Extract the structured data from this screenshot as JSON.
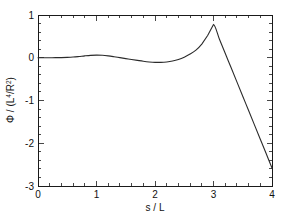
{
  "chart_data": {
    "type": "line",
    "title": "",
    "subtitle": "",
    "xlabel": "s / L",
    "ylabel": "Φ / (L⁴/R²)",
    "ylabel_parts": {
      "symbol": "Φ",
      "divider": " / (L",
      "num_exponent": "4",
      "mid": "/R",
      "den_exponent": "2",
      "close": ")"
    },
    "xlim": [
      0,
      4
    ],
    "ylim": [
      -3,
      1
    ],
    "xticks": [
      0,
      1,
      2,
      3,
      4
    ],
    "xticklabels": [
      "0",
      "1",
      "2",
      "3",
      "4"
    ],
    "yticks": [
      1,
      0,
      -1,
      -2,
      -3
    ],
    "yticklabels": [
      "1",
      "0",
      "-1",
      "-2",
      "-3"
    ],
    "x_minor_per_major": 5,
    "y_minor_per_major": 5,
    "grid": false,
    "legend": null,
    "frame": "box",
    "tick_direction": "in",
    "line_color": "#2b2b2b",
    "background_color": "#ffffff",
    "series": [
      {
        "name": "Phi",
        "x": [
          0.0,
          0.1,
          0.2,
          0.3,
          0.4,
          0.5,
          0.6,
          0.7,
          0.8,
          0.9,
          1.0,
          1.1,
          1.2,
          1.3,
          1.4,
          1.5,
          1.6,
          1.7,
          1.8,
          1.9,
          2.0,
          2.1,
          2.2,
          2.3,
          2.4,
          2.5,
          2.6,
          2.7,
          2.8,
          2.9,
          3.0,
          3.1,
          3.2,
          3.3,
          3.4,
          3.5,
          3.6,
          3.7,
          3.8,
          3.9,
          4.0
        ],
        "y": [
          0.0,
          0.0,
          0.001,
          0.002,
          0.004,
          0.008,
          0.016,
          0.029,
          0.044,
          0.056,
          0.062,
          0.058,
          0.044,
          0.024,
          0.002,
          -0.02,
          -0.042,
          -0.062,
          -0.082,
          -0.098,
          -0.108,
          -0.108,
          -0.098,
          -0.076,
          -0.04,
          0.014,
          0.086,
          0.18,
          0.32,
          0.52,
          0.78,
          0.44,
          0.105,
          -0.23,
          -0.565,
          -0.9,
          -1.235,
          -1.57,
          -1.905,
          -2.24,
          -2.58
        ]
      }
    ],
    "annotations": []
  },
  "figure": {
    "plot_area": {
      "left_px": 38,
      "right_px": 272,
      "top_px": 15,
      "bottom_px": 186
    }
  }
}
